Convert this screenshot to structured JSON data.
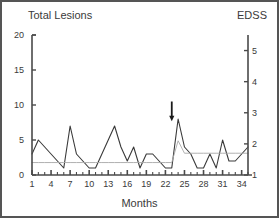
{
  "header": {
    "left_title": "Total Lesions",
    "right_title": "EDSS"
  },
  "chart_data": {
    "type": "line",
    "title": "Total Lesions",
    "xlabel": "Months",
    "ylabel": "Total Lesions",
    "y2label": "EDSS",
    "xlim": [
      1,
      35
    ],
    "ylim": [
      0,
      20
    ],
    "y2lim": [
      1,
      5.5
    ],
    "grid": false,
    "legend": null,
    "xticks": [
      1,
      4,
      7,
      10,
      13,
      16,
      19,
      22,
      25,
      28,
      31,
      34
    ],
    "yticks": [
      0,
      5,
      10,
      15,
      20
    ],
    "y2ticks": [
      1,
      2,
      3,
      4,
      5
    ],
    "x": [
      1,
      2,
      3,
      4,
      5,
      6,
      7,
      8,
      9,
      10,
      11,
      12,
      13,
      14,
      15,
      16,
      17,
      18,
      19,
      20,
      21,
      22,
      23,
      24,
      25,
      26,
      27,
      28,
      29,
      30,
      31,
      32,
      33,
      34,
      35
    ],
    "series": [
      {
        "name": "Total Lesions",
        "axis": "left",
        "color": "#3a3a3a",
        "values": [
          3,
          5,
          4,
          3,
          2,
          1,
          7,
          3,
          2,
          1,
          1,
          3,
          5,
          7,
          4,
          2,
          4,
          1,
          3,
          3,
          2,
          1,
          1,
          8,
          4,
          3,
          1,
          1,
          3,
          1,
          5,
          2,
          2,
          3,
          4
        ]
      },
      {
        "name": "EDSS",
        "axis": "right",
        "color": "#a8a8a8",
        "values": [
          1.4,
          1.4,
          1.4,
          1.4,
          1.4,
          1.4,
          1.4,
          1.4,
          1.4,
          1.4,
          1.4,
          1.4,
          1.4,
          1.4,
          1.4,
          1.4,
          1.4,
          1.4,
          1.4,
          1.4,
          1.4,
          1.4,
          1.4,
          2.1,
          1.7,
          1.7,
          1.7,
          1.7,
          1.7,
          1.7,
          1.7,
          1.7,
          1.7,
          1.7,
          1.7
        ]
      }
    ],
    "annotations": [
      {
        "type": "arrow",
        "label": "",
        "x": 23,
        "y": 10.5,
        "direction": "down",
        "color": "#1a1a1a"
      }
    ]
  }
}
